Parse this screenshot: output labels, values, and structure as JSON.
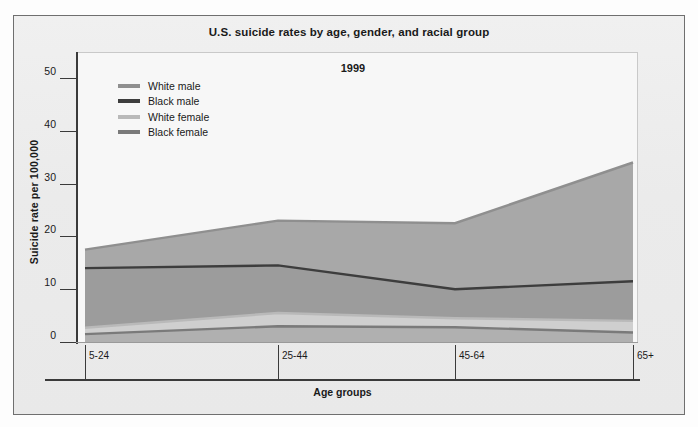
{
  "figure": {
    "title": "U.S. suicide rates by age, gender, and racial group",
    "year_annotation": "1999"
  },
  "axes": {
    "y_title": "Suicide rate per 100,000",
    "x_title": "Age groups",
    "y_ticks": [
      "0",
      "10",
      "20",
      "30",
      "40",
      "50"
    ],
    "x_ticks": [
      "5-24",
      "25-44",
      "45-64",
      "65+"
    ]
  },
  "legend": {
    "items": [
      {
        "label": "White male",
        "color": "#8f8f8f"
      },
      {
        "label": "Black male",
        "color": "#3d3d3d"
      },
      {
        "label": "White female",
        "color": "#b9b9b9"
      },
      {
        "label": "Black female",
        "color": "#7a7a7a"
      }
    ]
  },
  "chart_data": {
    "type": "area",
    "title": "U.S. suicide rates by age, gender, and racial group",
    "subtitle": "1999",
    "xlabel": "Age groups",
    "ylabel": "Suicide rate per 100,000",
    "categories": [
      "5-24",
      "25-44",
      "45-64",
      "65+"
    ],
    "ylim": [
      0,
      50
    ],
    "yticks": [
      0,
      10,
      20,
      30,
      40,
      50
    ],
    "grid": false,
    "legend_position": "upper-left",
    "series": [
      {
        "name": "White male",
        "color": "#8f8f8f",
        "fill": "#a8a8a8",
        "values": [
          17.5,
          23.0,
          22.5,
          34.0
        ]
      },
      {
        "name": "Black male",
        "color": "#3d3d3d",
        "fill": "#9c9c9c",
        "values": [
          14.0,
          14.5,
          10.0,
          11.5
        ]
      },
      {
        "name": "White female",
        "color": "#b9b9b9",
        "fill": "#cfcfcf",
        "values": [
          2.7,
          5.5,
          4.5,
          4.0
        ]
      },
      {
        "name": "Black female",
        "color": "#7a7a7a",
        "fill": "#b0b0b0",
        "values": [
          1.5,
          3.0,
          2.8,
          1.8
        ]
      }
    ]
  }
}
